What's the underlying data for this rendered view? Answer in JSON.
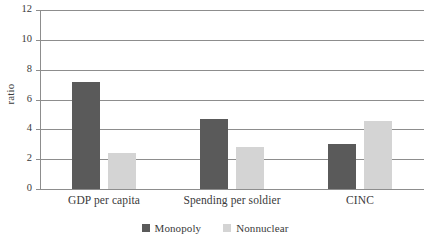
{
  "chart_data": {
    "type": "bar",
    "title": "",
    "xlabel": "",
    "ylabel": "ratio",
    "ylim": [
      0,
      12
    ],
    "yticks": [
      0,
      2,
      4,
      6,
      8,
      10,
      12
    ],
    "grid": true,
    "legend_position": "bottom-center",
    "categories": [
      "GDP per capita",
      "Spending per soldier",
      "CINC"
    ],
    "series": [
      {
        "name": "Monopoly",
        "color": "#5a5a5a",
        "values": [
          7.2,
          4.7,
          3.05
        ]
      },
      {
        "name": "Nonnuclear",
        "color": "#d4d4d4",
        "values": [
          2.4,
          2.85,
          4.55
        ]
      }
    ]
  },
  "axis": {
    "y_title": "ratio",
    "tick_labels": [
      "12",
      "10",
      "8",
      "6",
      "4",
      "2",
      "0"
    ]
  },
  "legend": {
    "items": [
      {
        "label": "Monopoly",
        "color": "#5a5a5a"
      },
      {
        "label": "Nonnuclear",
        "color": "#d4d4d4"
      }
    ]
  },
  "colors": {
    "monopoly": "#5a5a5a",
    "nonnuclear": "#d4d4d4",
    "axis": "#8d8d8d",
    "text": "#3a3a3a",
    "background": "#ffffff"
  }
}
